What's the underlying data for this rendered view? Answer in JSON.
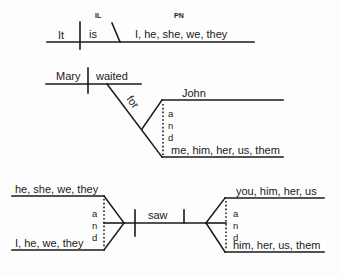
{
  "diagram_1": {
    "subject": "It",
    "verb": "is",
    "label_il": "IL",
    "label_pn": "PN",
    "predicate_nominative": "I, he, she, we, they"
  },
  "diagram_2": {
    "subject": "Mary",
    "verb": "waited",
    "preposition": "for",
    "object_top": "John",
    "object_bottom": "me, him, her, us, them",
    "conjunction": [
      "a",
      "n",
      "d"
    ]
  },
  "diagram_3": {
    "subject_top": "he, she, we, they",
    "subject_bottom": "I, he, we, they",
    "subject_conjunction": [
      "a",
      "n",
      "d"
    ],
    "verb": "saw",
    "object_top": "you, him, her, us",
    "object_bottom": "him, her, us, them",
    "object_conjunction": [
      "a",
      "n",
      "d"
    ]
  },
  "colors": {
    "ink": "#1a1a1a",
    "background": "#fdfdfd"
  }
}
